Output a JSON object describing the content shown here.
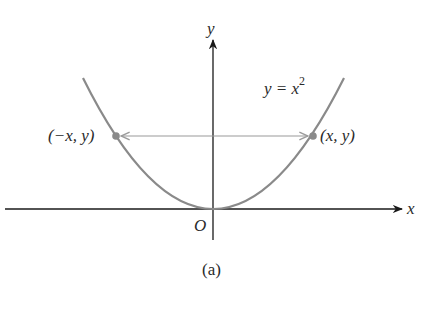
{
  "figure": {
    "caption": "(a)",
    "axes": {
      "x_label": "x",
      "y_label": "y",
      "origin_label": "O"
    },
    "curve": {
      "equation_lhs": "y = x",
      "equation_exponent": "2",
      "color": "#8a8a8a"
    },
    "points": {
      "left_label": "(−x, y)",
      "right_label": "(x, y)",
      "color": "#8a8a8a"
    },
    "arrow": {
      "type": "double-headed",
      "color": "#9a9a9a"
    },
    "axis_color": "#1a1a1a"
  }
}
